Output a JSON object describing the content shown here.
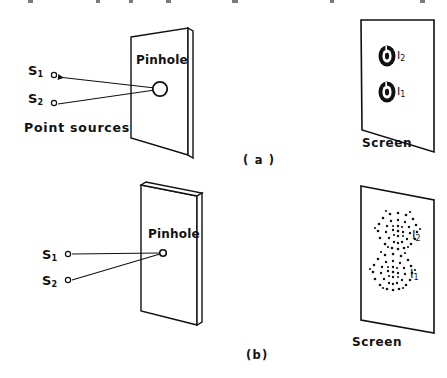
{
  "figure": {
    "type": "optics-diagram",
    "ink_color": "#111111",
    "background_color": "#ffffff"
  },
  "panel_a": {
    "caption": "( a )",
    "pinhole_label": "Pinhole",
    "pinhole_size": "large",
    "source_1": "S",
    "source_1_sub": "1",
    "source_2": "S",
    "source_2_sub": "2",
    "sources_caption": "Point sources",
    "screen_label": "Screen",
    "spot_2": "I",
    "spot_2_sub": "2",
    "spot_1": "I",
    "spot_1_sub": "1",
    "pattern_type": "small sharp spots"
  },
  "panel_b": {
    "caption": "(b)",
    "pinhole_label": "Pinhole",
    "pinhole_size": "small",
    "source_1": "S",
    "source_1_sub": "1",
    "source_2": "S",
    "source_2_sub": "2",
    "screen_label": "Screen",
    "spot_2": "I",
    "spot_2_sub": "2",
    "spot_1": "I",
    "spot_1_sub": "1",
    "pattern_type": "large dotted diffraction rings"
  }
}
